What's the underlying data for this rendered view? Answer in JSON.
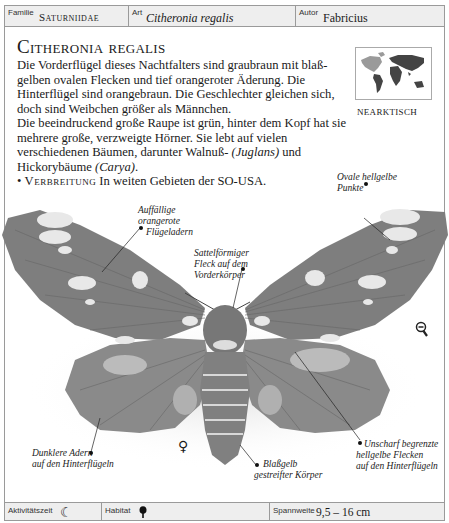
{
  "header": {
    "family_label": "Familie",
    "family_value": "Saturniidae",
    "species_label": "Art",
    "species_value": "Citheronia regalis",
    "author_label": "Autor",
    "author_value": "Fabricius"
  },
  "article": {
    "title": "Citheronia regalis",
    "paragraph1": "Die Vorderflügel dieses Nachtfalters sind graubraun mit blaß­gelben ovalen Flecken und tief orangeroter Äderung. Die Hinterflügel sind orangebraun. Die Geschlechter gleichen sich, doch sind Weibchen größer als Männchen.",
    "paragraph2_start": "Die beeindruckend große Raupe ist grün, hinter dem Kopf hat sie mehrere große, verzweigte Hörner. Sie lebt auf vielen verschiedenen Bäumen, darunter Walnuß- ",
    "juglans": "(Juglans)",
    "paragraph2_mid": " und Hickorybäume ",
    "carya": "(Carya)",
    "paragraph2_end": ".",
    "distribution_label": "Verbreitung",
    "distribution_text": "In weiten Gebieten der SO-USA."
  },
  "map": {
    "region_label": "NEARKTISCH"
  },
  "annotations": {
    "veins": [
      "Auffällige",
      "orangerote",
      "Flügeladern"
    ],
    "saddle": [
      "Sattelförmiger",
      "Fleck auf dem",
      "Vorderkörper"
    ],
    "spots": [
      "Ovale hellgelbe",
      "Punkte"
    ],
    "dark_veins": [
      "Dunklere Adern",
      "auf den Hinterflügeln"
    ],
    "body": [
      "Blaßgelb",
      "gestreifter Körper"
    ],
    "hind_spots": [
      "Unscharf begrenzte",
      "hellgelbe Flecken",
      "auf den Hinterflügeln"
    ]
  },
  "sex_symbol": "♀",
  "icons": {
    "zoom": "zoom-out-icon",
    "activity": "moon-icon",
    "habitat": "tree-icon"
  },
  "footer": {
    "activity_label": "Aktivitätszeit",
    "activity_icon": "☾",
    "habitat_label": "Habitat",
    "wingspan_label": "Spannweite",
    "wingspan_value": "9,5 – 16 cm"
  }
}
